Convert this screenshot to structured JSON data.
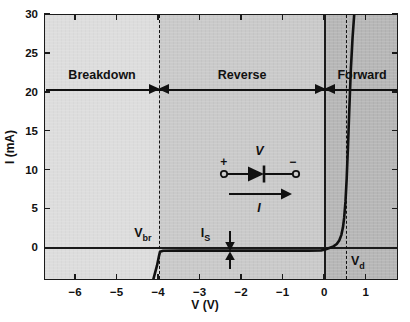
{
  "chart_data": {
    "type": "line",
    "title": "",
    "xlabel": "V (V)",
    "ylabel": "I (mA)",
    "xlim": [
      -6.75,
      1.78
    ],
    "ylim": [
      -4.2,
      30
    ],
    "grid": false,
    "legend": "none",
    "xticks": [
      "−6",
      "−5",
      "−4",
      "−3",
      "−2",
      "−1",
      "0",
      "1"
    ],
    "xtick_values": [
      -6,
      -5,
      -4,
      -3,
      -2,
      -1,
      0,
      1
    ],
    "yticks": [
      "0",
      "5",
      "10",
      "15",
      "20",
      "25",
      "30"
    ],
    "ytick_values": [
      0,
      5,
      10,
      15,
      20,
      25,
      30
    ],
    "series": [
      {
        "name": "Diode I-V characteristic",
        "x": [
          -6.75,
          -4.15,
          -4.05,
          -4.0,
          -3.98,
          -3.9,
          -3.5,
          -3.0,
          -2.0,
          -1.0,
          -0.4,
          -0.1,
          0.0,
          0.1,
          0.2,
          0.28,
          0.34,
          0.39,
          0.43,
          0.46,
          0.49,
          0.52,
          0.55,
          0.58,
          0.62,
          0.66,
          0.7
        ],
        "y": [
          -4.2,
          -4.2,
          -2.2,
          -0.9,
          -0.45,
          -0.32,
          -0.3,
          -0.3,
          -0.3,
          -0.3,
          -0.3,
          -0.28,
          -0.15,
          0.05,
          0.25,
          0.55,
          1.0,
          1.7,
          2.7,
          4.0,
          6.0,
          9.0,
          13.0,
          17.5,
          23.0,
          27.0,
          30.0
        ]
      }
    ],
    "markers": [
      {
        "name": "breakdown-voltage",
        "label": "V",
        "sub": "br",
        "x": -4.0,
        "style": "dashed-vertical"
      },
      {
        "name": "forward-voltage",
        "label": "V",
        "sub": "d",
        "x": 0.5,
        "style": "dashed-vertical"
      },
      {
        "name": "saturation-current",
        "label": "I",
        "sub": "S",
        "x": -2.85,
        "style": "double-arrow"
      }
    ],
    "regions": [
      {
        "name": "breakdown",
        "label": "Breakdown",
        "x_from": -6.75,
        "x_to": -4.0,
        "color": "#dcdcdc"
      },
      {
        "name": "reverse",
        "label": "Reverse",
        "x_from": -4.0,
        "x_to": 0.0,
        "color": "#c8c8c8"
      },
      {
        "name": "forward",
        "label": "Forward",
        "x_from": 0.0,
        "x_to": 1.78,
        "color": "#b4b4b4"
      }
    ],
    "region_arrow_level": 20.5,
    "schematic": {
      "name": "diode-symbol",
      "voltage_label": "V",
      "current_label": "I",
      "plus_sign": "+",
      "minus_sign": "−"
    },
    "colors": {
      "axis": "#1a1a1a",
      "curve": "#111111",
      "breakdown_band": "#dcdcdc",
      "reverse_band": "#c8c8c8",
      "forward_band": "#b4b4b4",
      "background": "#ffffff"
    }
  }
}
